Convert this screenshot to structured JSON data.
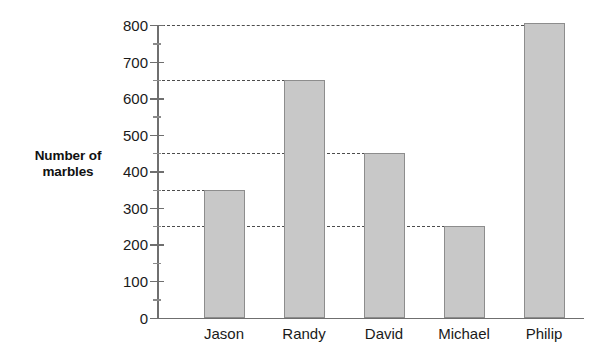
{
  "chart_data": {
    "type": "bar",
    "title": "",
    "xlabel": "",
    "ylabel": "Number of marbles",
    "ylabel_lines": [
      "Number of",
      "marbles"
    ],
    "categories": [
      "Jason",
      "Randy",
      "David",
      "Michael",
      "Philip"
    ],
    "values": [
      350,
      650,
      450,
      250,
      805
    ],
    "ylim": [
      0,
      800
    ],
    "ytick_values": [
      0,
      100,
      200,
      300,
      400,
      500,
      600,
      700,
      800
    ],
    "ytick_labels": [
      "0",
      "100",
      "200",
      "300",
      "400",
      "500",
      "600",
      "700",
      "800"
    ],
    "yminor_values": [
      50,
      150,
      250,
      350,
      450,
      550,
      650,
      750
    ],
    "reference_lines": [
      250,
      350,
      450,
      650,
      800
    ],
    "grid": false,
    "legend": null,
    "series": [
      {
        "name": "Number of marbles",
        "values": [
          350,
          650,
          450,
          250,
          805
        ]
      }
    ],
    "colors": {
      "bar_fill": "#c8c8c8",
      "bar_border": "#8d8d8d",
      "axis": "#6f6f6f",
      "reference_line": "#4d4d4d",
      "text": "#1a1a1a",
      "background": "#ffffff"
    }
  }
}
